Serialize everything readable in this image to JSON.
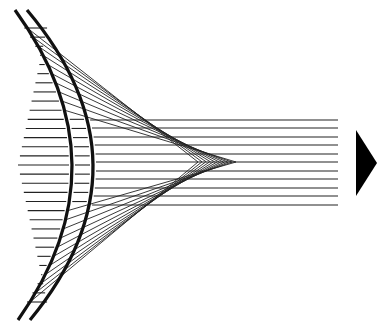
{
  "diagram": {
    "type": "optics-ray-diagram",
    "colors": {
      "background": "#ffffff",
      "stroke": "#111111",
      "arrow": "#000000"
    },
    "lens": {
      "outer_arc": {
        "top": [
          15,
          10
        ],
        "middle": [
          72,
          165
        ],
        "bottom": [
          18,
          320
        ]
      },
      "inner_arc": {
        "top": [
          27,
          10
        ],
        "middle": [
          93,
          165
        ],
        "bottom": [
          30,
          320
        ]
      }
    },
    "incoming_rays": {
      "count": 31,
      "y_start": 28,
      "y_end": 302,
      "x_start": 18
    },
    "focus": {
      "x_min": 198,
      "x_max": 236,
      "y": 162
    },
    "passing_rays": {
      "y_values": [
        120,
        128,
        137,
        145,
        154,
        162,
        171,
        179,
        188,
        196,
        205
      ],
      "x_end": 338
    },
    "arrow": {
      "points": [
        [
          356,
          130
        ],
        [
          377,
          163
        ],
        [
          356,
          196
        ]
      ],
      "direction": "right"
    }
  }
}
